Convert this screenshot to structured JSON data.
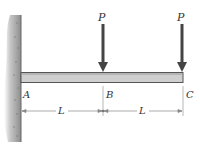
{
  "diagram": {
    "type": "cantilever-beam",
    "support": {
      "label": "A",
      "kind": "fixed-wall"
    },
    "points": [
      {
        "label": "A",
        "x": 21
      },
      {
        "label": "B",
        "x": 103
      },
      {
        "label": "C",
        "x": 183
      }
    ],
    "loads": [
      {
        "label": "P",
        "at": "B"
      },
      {
        "label": "P",
        "at": "C"
      }
    ],
    "dimensions": [
      {
        "label": "L",
        "from": "A",
        "to": "B"
      },
      {
        "label": "L",
        "from": "B",
        "to": "C"
      }
    ],
    "colors": {
      "beam_fill": "#cfcfcf",
      "beam_edge": "#555555",
      "arrow": "#444444",
      "wall": "#8a8a8a"
    }
  }
}
